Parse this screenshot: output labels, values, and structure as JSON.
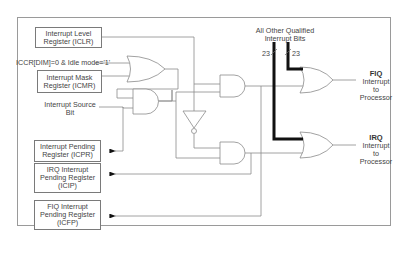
{
  "diagram": {
    "registers": {
      "iclr": "Interrupt Level Register (ICLR)",
      "icmr": "Interrupt Mask Register (ICMR)",
      "icpr": "Interrupt Pending Register (ICPR)",
      "icip": "IRQ Interrupt Pending Register (ICIP)",
      "icfp": "FIQ Interrupt Pending Register (ICFP)"
    },
    "labels": {
      "iccr_condition": "ICCR[DIM]=0 & Idle mode='1'",
      "interrupt_source": "Interrupt Source Bit",
      "other_bits_line1": "All Other Qualified",
      "other_bits_line2": "Interrupt Bits",
      "bus_width_left": "23",
      "bus_width_right": "23"
    },
    "outputs": {
      "fiq": {
        "title": "FIQ",
        "line1": "Interrupt",
        "line2": "to",
        "line3": "Processor"
      },
      "irq": {
        "title": "IRQ",
        "line1": "Interrupt",
        "line2": "to",
        "line3": "Processor"
      }
    },
    "gates": [
      "OR",
      "AND",
      "AND",
      "NOT",
      "AND",
      "OR (FIQ)",
      "OR (IRQ)"
    ],
    "colors": {
      "line": "#8a8a8a",
      "bus": "#111111",
      "box_border": "#7a7a7a"
    }
  }
}
